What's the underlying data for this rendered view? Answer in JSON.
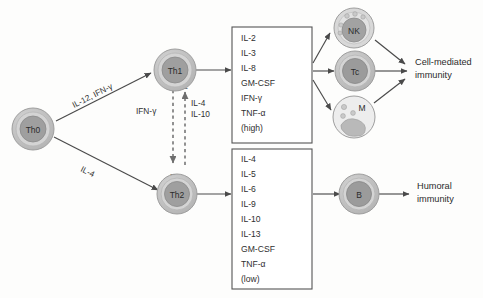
{
  "diagram": {
    "colors": {
      "cell_outer": "#bdbdbd",
      "cell_rim": "#d2d2d2",
      "cell_nucleus": "#9a9a9a",
      "macrophage_body": "#ececec",
      "arrow": "#4a4a4a",
      "dashed_arrow": "#6e6e6e",
      "box_stroke": "#555555",
      "text": "#2b2b2b",
      "background": "#fdfdfc"
    },
    "cells": [
      {
        "id": "th0",
        "label": "Th0",
        "type": "lymphocyte"
      },
      {
        "id": "th1",
        "label": "Th1",
        "type": "lymphocyte"
      },
      {
        "id": "th2",
        "label": "Th2",
        "type": "lymphocyte"
      },
      {
        "id": "nk",
        "label": "NK",
        "type": "granular-lymphocyte"
      },
      {
        "id": "tc",
        "label": "Tc",
        "type": "lymphocyte"
      },
      {
        "id": "m",
        "label": "M",
        "type": "macrophage"
      },
      {
        "id": "b",
        "label": "B",
        "type": "lymphocyte"
      }
    ],
    "edge_labels": {
      "th0_to_th1": "IL-12, IFN-γ",
      "th0_to_th2": "IL-4",
      "th1_inhibits_th2": "IFN-γ",
      "th2_inhibits_th1_line1": "IL-4",
      "th2_inhibits_th1_line2": "IL-10",
      "inhibition_symbol": "–"
    },
    "cytokine_boxes": [
      {
        "id": "th1-cytokines",
        "source": "Th1",
        "items": [
          "IL-2",
          "IL-3",
          "IL-8",
          "GM-CSF",
          "IFN-γ",
          "TNF-α",
          "(high)"
        ]
      },
      {
        "id": "th2-cytokines",
        "source": "Th2",
        "items": [
          "IL-4",
          "IL-5",
          "IL-6",
          "IL-9",
          "IL-10",
          "IL-13",
          "GM-CSF",
          "TNF-α",
          "(low)"
        ]
      }
    ],
    "outcomes": [
      {
        "id": "cell-mediated",
        "line1": "Cell-mediated",
        "line2": "immunity"
      },
      {
        "id": "humoral",
        "line1": "Humoral",
        "line2": "immunity"
      }
    ]
  }
}
